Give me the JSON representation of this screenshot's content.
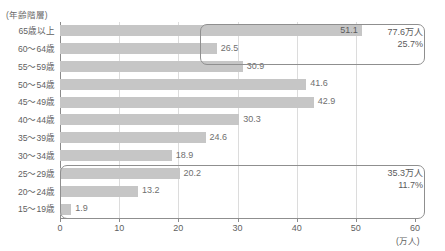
{
  "chart_data": {
    "type": "bar",
    "orientation": "horizontal",
    "title": "",
    "subtitle": "",
    "xlabel": "(万人)",
    "ylabel": "(年齢階層)",
    "xlim": [
      0,
      60
    ],
    "ylim": null,
    "grid": "vertical",
    "legend": null,
    "xticks": [
      "0",
      "10",
      "20",
      "30",
      "40",
      "50",
      "60"
    ],
    "xtick_values": [
      0,
      10,
      20,
      30,
      40,
      50,
      60
    ],
    "categories": [
      "65歳以上",
      "60〜64歳",
      "55〜59歳",
      "50〜54歳",
      "45〜49歳",
      "40〜44歳",
      "35〜39歳",
      "30〜34歳",
      "25〜29歳",
      "20〜24歳",
      "15〜19歳"
    ],
    "values": [
      51.1,
      26.5,
      30.9,
      41.6,
      42.9,
      30.3,
      24.6,
      18.9,
      20.2,
      13.2,
      1.9
    ],
    "value_labels": [
      "51.1",
      "26.5",
      "30.9",
      "41.6",
      "42.9",
      "30.3",
      "24.6",
      "18.9",
      "20.2",
      "13.2",
      "1.9"
    ],
    "bar_color": "#c6c6c6",
    "annotations": [
      {
        "id": "upper-group",
        "covers_categories": [
          "65歳以上",
          "60〜64歳"
        ],
        "line1": "77.6万人",
        "line2": "25.7%"
      },
      {
        "id": "lower-group",
        "covers_categories": [
          "25〜29歳",
          "20〜24歳",
          "15〜19歳"
        ],
        "line1": "35.3万人",
        "line2": "11.7%"
      }
    ]
  }
}
